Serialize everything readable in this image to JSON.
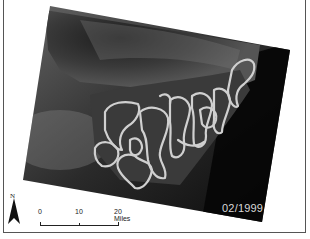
{
  "map": {
    "date_label": "02/1999",
    "north_arrow": {
      "icon": "north-arrow-icon",
      "label": "N"
    },
    "scale_bar": {
      "ticks": [
        "0",
        "10",
        "20 Miles"
      ]
    },
    "colors": {
      "background": "#ffffff",
      "outline_stroke": "#d0d0d0",
      "imagery_dark": "#0a0a0a",
      "frame": "#555555"
    }
  }
}
